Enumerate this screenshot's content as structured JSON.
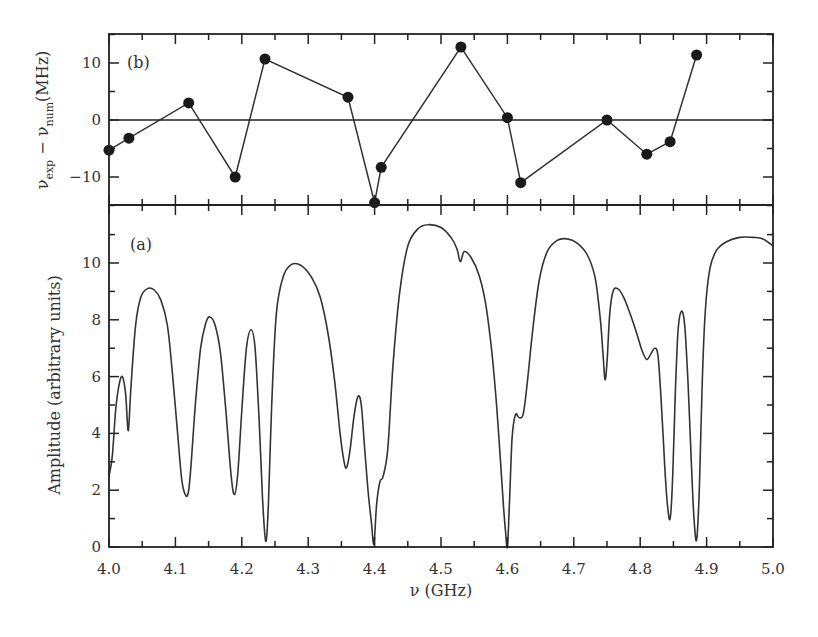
{
  "figure": {
    "xlabel": "ν (GHz)",
    "panel_b_label": "(b)",
    "panel_a_label": "(a)",
    "panel_b_ylabel_main": "ν",
    "panel_b_ylabel_sub1": "exp",
    "panel_b_ylabel_mid": " − ν",
    "panel_b_ylabel_sub2": "num",
    "panel_b_ylabel_unit": "(MHz)",
    "panel_a_ylabel": "Amplitude (arbitrary units)",
    "colors": {
      "line": "#333333",
      "frame": "#222222",
      "background": "#ffffff"
    }
  },
  "chart_data": [
    {
      "panel": "b",
      "type": "line",
      "title": "",
      "label": "(b)",
      "xlabel": "ν (GHz)",
      "ylabel": "ν_exp − ν_num (MHz)",
      "xlim": [
        4.0,
        5.0
      ],
      "ylim": [
        -15,
        15
      ],
      "yticks": [
        -10,
        0,
        10
      ],
      "yticks_minor": [
        -15,
        -5,
        5,
        15
      ],
      "xticks": [
        4.0,
        4.1,
        4.2,
        4.3,
        4.4,
        4.5,
        4.6,
        4.7,
        4.8,
        4.9,
        5.0
      ],
      "reference_line": 0,
      "markers": "filled-circle",
      "x": [
        4.0,
        4.03,
        4.12,
        4.19,
        4.235,
        4.36,
        4.4,
        4.41,
        4.53,
        4.6,
        4.62,
        4.75,
        4.81,
        4.845,
        4.885
      ],
      "y": [
        -5.3,
        -3.2,
        3.0,
        -10.0,
        10.7,
        4.0,
        -14.5,
        -8.3,
        12.8,
        0.4,
        -11.0,
        0.0,
        -6.0,
        -3.8,
        11.4
      ]
    },
    {
      "panel": "a",
      "type": "line",
      "title": "",
      "label": "(a)",
      "xlabel": "ν (GHz)",
      "ylabel": "Amplitude (arbitrary units)",
      "xlim": [
        4.0,
        5.0
      ],
      "ylim": [
        0,
        11.5
      ],
      "yticks": [
        0,
        2,
        4,
        6,
        8,
        10
      ],
      "xticks": [
        4.0,
        4.1,
        4.2,
        4.3,
        4.4,
        4.5,
        4.6,
        4.7,
        4.8,
        4.9,
        5.0
      ],
      "xtick_labels": [
        "4.0",
        "4.1",
        "4.2",
        "4.3",
        "4.4",
        "4.5",
        "4.6",
        "4.7",
        "4.8",
        "4.9",
        "5.0"
      ],
      "x": [
        4.0,
        4.005,
        4.01,
        4.015,
        4.02,
        4.025,
        4.029,
        4.033,
        4.04,
        4.048,
        4.058,
        4.068,
        4.078,
        4.088,
        4.096,
        4.104,
        4.11,
        4.116,
        4.12,
        4.124,
        4.13,
        4.138,
        4.146,
        4.152,
        4.16,
        4.168,
        4.176,
        4.184,
        4.189,
        4.194,
        4.2,
        4.207,
        4.214,
        4.22,
        4.226,
        4.231,
        4.236,
        4.24,
        4.245,
        4.252,
        4.262,
        4.275,
        4.29,
        4.305,
        4.318,
        4.33,
        4.34,
        4.348,
        4.354,
        4.358,
        4.363,
        4.369,
        4.375,
        4.38,
        4.385,
        4.39,
        4.395,
        4.399,
        4.403,
        4.408,
        4.413,
        4.42,
        4.428,
        4.438,
        4.45,
        4.465,
        4.48,
        4.5,
        4.515,
        4.524,
        4.529,
        4.535,
        4.545,
        4.557,
        4.567,
        4.575,
        4.582,
        4.588,
        4.593,
        4.597,
        4.6,
        4.603,
        4.607,
        4.612,
        4.618,
        4.624,
        4.63,
        4.638,
        4.648,
        4.66,
        4.675,
        4.69,
        4.705,
        4.72,
        4.732,
        4.74,
        4.744,
        4.747,
        4.75,
        4.754,
        4.759,
        4.766,
        4.775,
        4.785,
        4.795,
        4.803,
        4.81,
        4.816,
        4.822,
        4.827,
        4.832,
        4.837,
        4.841,
        4.845,
        4.849,
        4.853,
        4.857,
        4.862,
        4.867,
        4.872,
        4.877,
        4.881,
        4.885,
        4.889,
        4.893,
        4.898,
        4.905,
        4.915,
        4.93,
        4.95,
        4.97,
        4.985,
        5.0
      ],
      "y": [
        2.5,
        3.2,
        4.8,
        5.7,
        6.0,
        5.4,
        4.1,
        5.6,
        7.8,
        8.8,
        9.1,
        9.05,
        8.7,
        7.8,
        6.0,
        3.8,
        2.3,
        1.8,
        2.0,
        3.0,
        5.0,
        7.0,
        7.9,
        8.1,
        7.8,
        6.8,
        4.8,
        2.5,
        1.85,
        2.6,
        4.8,
        7.0,
        7.65,
        7.0,
        4.5,
        1.8,
        0.2,
        1.5,
        5.0,
        8.2,
        9.5,
        9.95,
        9.9,
        9.5,
        8.8,
        7.5,
        5.8,
        4.0,
        3.0,
        2.8,
        3.4,
        4.6,
        5.3,
        5.0,
        3.5,
        2.0,
        0.9,
        0.1,
        1.5,
        2.3,
        2.5,
        3.5,
        6.5,
        9.0,
        10.6,
        11.2,
        11.35,
        11.25,
        10.9,
        10.5,
        10.05,
        10.4,
        10.2,
        9.6,
        8.6,
        7.2,
        5.5,
        3.6,
        1.8,
        0.6,
        0.0,
        1.5,
        3.8,
        4.65,
        4.55,
        4.7,
        5.8,
        7.6,
        9.4,
        10.4,
        10.8,
        10.85,
        10.7,
        10.3,
        9.5,
        8.0,
        6.8,
        5.9,
        6.5,
        8.2,
        9.0,
        9.1,
        8.8,
        8.2,
        7.5,
        6.9,
        6.6,
        6.8,
        7.0,
        6.7,
        5.0,
        2.8,
        1.5,
        1.0,
        2.5,
        5.5,
        7.6,
        8.3,
        7.8,
        5.8,
        3.0,
        1.0,
        0.25,
        2.0,
        5.5,
        8.3,
        9.8,
        10.45,
        10.75,
        10.9,
        10.9,
        10.85,
        10.6
      ]
    }
  ]
}
